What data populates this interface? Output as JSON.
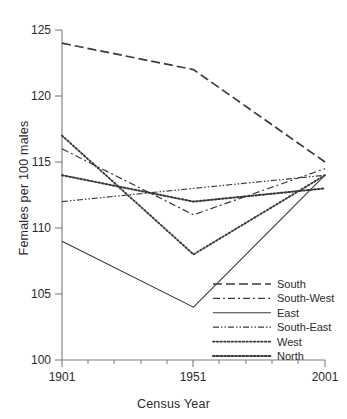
{
  "chart_data": {
    "type": "line",
    "title": "",
    "xlabel": "Census Year",
    "ylabel": "Females per 100 males",
    "x": [
      1901,
      1951,
      2001
    ],
    "xticklabels": [
      "1901",
      "1951",
      "2001"
    ],
    "xlim": [
      1901,
      2001
    ],
    "ylim": [
      100,
      125
    ],
    "yticks": [
      100,
      105,
      110,
      115,
      120,
      125
    ],
    "yticklabels": [
      "100",
      "105",
      "110",
      "115",
      "120",
      "125"
    ],
    "grid": false,
    "legend_position": "lower-right-inside",
    "series": [
      {
        "name": "South",
        "values": [
          124,
          122,
          115
        ],
        "style": "long-dash",
        "dasharray": "9,4"
      },
      {
        "name": "South-West",
        "values": [
          116,
          111,
          114.5
        ],
        "style": "dash-dot",
        "dasharray": "7,3,2,3"
      },
      {
        "name": "East",
        "values": [
          109,
          104,
          114
        ],
        "style": "solid",
        "dasharray": "none"
      },
      {
        "name": "South-East",
        "values": [
          112,
          113,
          114
        ],
        "style": "dash-dot-dot",
        "dasharray": "6,2,1.5,2,1.5,2"
      },
      {
        "name": "West",
        "values": [
          117,
          108,
          114
        ],
        "style": "dotted",
        "dasharray": "1.6,2.1"
      },
      {
        "name": "North",
        "values": [
          114,
          112,
          113
        ],
        "style": "dotted-bold",
        "dasharray": "1.8,1.9"
      }
    ]
  },
  "axes": {
    "y_title": "Females per 100 males",
    "x_title": "Census Year",
    "y_tick_labels": [
      "125",
      "120",
      "115",
      "110",
      "105",
      "100"
    ],
    "x_tick_labels": [
      "1901",
      "1951",
      "2001"
    ]
  },
  "legend": {
    "entries": [
      {
        "label": "South"
      },
      {
        "label": "South-West"
      },
      {
        "label": "East"
      },
      {
        "label": "South-East"
      },
      {
        "label": "West"
      },
      {
        "label": "North"
      }
    ]
  },
  "colors": {
    "line": "#3a3a3a",
    "axis": "#7d7d7d",
    "text": "#2b2b2b",
    "background": "#ffffff"
  }
}
